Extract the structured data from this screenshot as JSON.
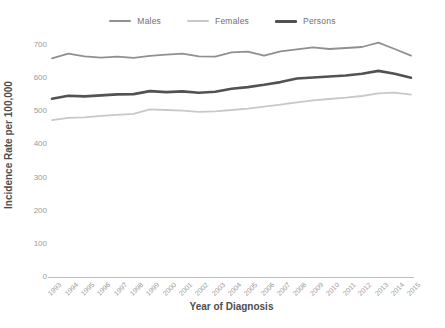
{
  "chart_data": {
    "type": "line",
    "title": "",
    "xlabel": "Year of Diagnosis",
    "ylabel": "Incidence Rate per 100,000",
    "x": [
      1993,
      1994,
      1995,
      1996,
      1997,
      1998,
      1999,
      2000,
      2001,
      2002,
      2003,
      2004,
      2005,
      2006,
      2007,
      2008,
      2009,
      2010,
      2011,
      2012,
      2013,
      2014,
      2015
    ],
    "series": [
      {
        "name": "Males",
        "color": "#909090",
        "line_width": 1.8,
        "values": [
          660,
          674,
          666,
          662,
          665,
          661,
          667,
          671,
          674,
          666,
          665,
          678,
          680,
          668,
          681,
          687,
          693,
          688,
          691,
          694,
          707,
          688,
          668
        ]
      },
      {
        "name": "Females",
        "color": "#c8c8c8",
        "line_width": 1.8,
        "values": [
          473,
          480,
          482,
          486,
          489,
          492,
          506,
          504,
          502,
          498,
          500,
          504,
          508,
          514,
          520,
          527,
          533,
          537,
          541,
          546,
          554,
          556,
          550
        ]
      },
      {
        "name": "Persons",
        "color": "#525252",
        "line_width": 2.6,
        "values": [
          538,
          547,
          545,
          548,
          551,
          552,
          561,
          558,
          560,
          556,
          559,
          568,
          573,
          580,
          588,
          599,
          602,
          605,
          608,
          613,
          622,
          613,
          601
        ]
      }
    ],
    "ylim": [
      0,
      700
    ],
    "yticks": [
      0,
      100,
      200,
      300,
      400,
      500,
      600,
      700
    ],
    "grid": false,
    "legend_position": "top",
    "axis_line_color": "#bdbdbd",
    "tick_label_color": "#9a9a9a",
    "axis_title_color": "#4e4e4e"
  }
}
